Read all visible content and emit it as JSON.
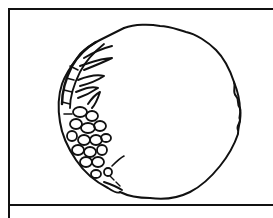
{
  "figure": {
    "stroke_color": "#111111",
    "background_color": "#ffffff"
  }
}
